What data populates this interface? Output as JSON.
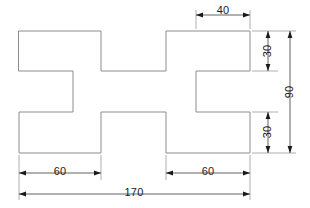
{
  "drawing": {
    "type": "engineering-dimensioned-outline",
    "units_note": "",
    "canvas": {
      "width": 310,
      "height": 208
    },
    "shape": {
      "name": "stepped-cross-profile",
      "outline_points_px": [
        [
          19,
          31
        ],
        [
          101,
          31
        ],
        [
          101,
          71
        ],
        [
          166,
          71
        ],
        [
          166,
          31
        ],
        [
          250,
          31
        ],
        [
          250,
          71
        ],
        [
          196,
          71
        ],
        [
          196,
          112
        ],
        [
          250,
          112
        ],
        [
          250,
          153
        ],
        [
          166,
          153
        ],
        [
          166,
          112
        ],
        [
          101,
          112
        ],
        [
          101,
          153
        ],
        [
          19,
          153
        ],
        [
          19,
          112
        ],
        [
          73,
          112
        ],
        [
          73,
          71
        ],
        [
          19,
          71
        ]
      ]
    },
    "dimensions": [
      {
        "id": "dim-40-top",
        "value": "40",
        "orientation": "horizontal",
        "position": "top-right"
      },
      {
        "id": "dim-30-upper",
        "value": "30",
        "orientation": "vertical",
        "position": "right-upper"
      },
      {
        "id": "dim-30-lower",
        "value": "30",
        "orientation": "vertical",
        "position": "right-lower"
      },
      {
        "id": "dim-90-overall",
        "value": "90",
        "orientation": "vertical",
        "position": "far-right"
      },
      {
        "id": "dim-60-left",
        "value": "60",
        "orientation": "horizontal",
        "position": "bottom-left"
      },
      {
        "id": "dim-60-right",
        "value": "60",
        "orientation": "horizontal",
        "position": "bottom-right"
      },
      {
        "id": "dim-170-overall",
        "value": "170",
        "orientation": "horizontal",
        "position": "bottom-overall"
      }
    ],
    "colors": {
      "outline": "#8c8c8c",
      "dimension": "#3a3a3a",
      "arrow": "#1a1a1a",
      "text": "#1a1a1a",
      "background": "#ffffff"
    }
  }
}
